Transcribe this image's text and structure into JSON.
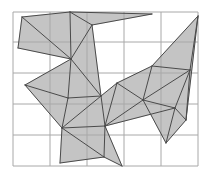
{
  "figure": {
    "width": 211,
    "height": 179,
    "colors": {
      "background": "#ffffff",
      "grid": "#a8a8a8",
      "fill": "#c4c4c4",
      "edge": "#4a4a4a"
    },
    "grid": {
      "x_lines": [
        13,
        50,
        87,
        124,
        161,
        198
      ],
      "y_lines": [
        12,
        42,
        73,
        104,
        135,
        166
      ]
    },
    "vertices": {
      "A": [
        22,
        17
      ],
      "B": [
        70,
        12
      ],
      "C": [
        152,
        14
      ],
      "D": [
        92,
        25
      ],
      "E": [
        18,
        48
      ],
      "F": [
        71,
        59
      ],
      "G": [
        25,
        85
      ],
      "H": [
        117,
        83
      ],
      "I": [
        198,
        16
      ],
      "J": [
        152,
        66
      ],
      "K": [
        190,
        70
      ],
      "L": [
        68,
        98
      ],
      "M": [
        101,
        96
      ],
      "N": [
        143,
        100
      ],
      "O": [
        175,
        108
      ],
      "P": [
        62,
        128
      ],
      "Q": [
        105,
        126
      ],
      "R": [
        186,
        120
      ],
      "S": [
        166,
        143
      ],
      "T": [
        60,
        163
      ],
      "U": [
        104,
        157
      ],
      "V": [
        122,
        166
      ],
      "W": [
        36,
        44
      ]
    },
    "triangles": [
      [
        "A",
        "B",
        "F"
      ],
      [
        "A",
        "E",
        "F"
      ],
      [
        "B",
        "D",
        "F"
      ],
      [
        "B",
        "C",
        "D"
      ],
      [
        "D",
        "F",
        "M"
      ],
      [
        "F",
        "G",
        "L"
      ],
      [
        "F",
        "L",
        "M"
      ],
      [
        "G",
        "L",
        "P"
      ],
      [
        "L",
        "M",
        "P"
      ],
      [
        "M",
        "P",
        "Q"
      ],
      [
        "M",
        "H",
        "Q"
      ],
      [
        "H",
        "N",
        "Q"
      ],
      [
        "H",
        "J",
        "N"
      ],
      [
        "J",
        "I",
        "K"
      ],
      [
        "J",
        "K",
        "N"
      ],
      [
        "N",
        "K",
        "O"
      ],
      [
        "N",
        "O",
        "Q"
      ],
      [
        "O",
        "R",
        "S"
      ],
      [
        "N",
        "O",
        "S"
      ],
      [
        "P",
        "Q",
        "U"
      ],
      [
        "P",
        "T",
        "U"
      ],
      [
        "Q",
        "U",
        "V"
      ],
      [
        "I",
        "K",
        "R"
      ],
      [
        "K",
        "O",
        "R"
      ]
    ]
  }
}
